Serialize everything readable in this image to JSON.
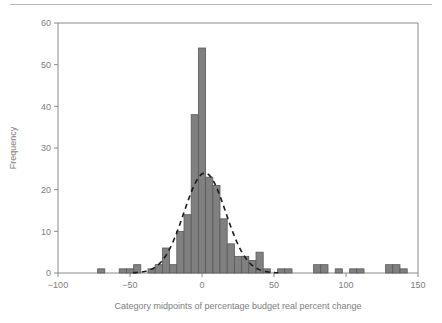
{
  "figure": {
    "background_color": "#ffffff",
    "top_rule_color": "#b9b9b9",
    "axis_color": "#8a8a8a",
    "text_color": "#7d7d7d",
    "bar_fill_color": "#808080",
    "bar_stroke_color": "#595959",
    "curve_color": "#1a1a1a"
  },
  "chart_data": {
    "type": "bar",
    "title": "",
    "subtitle": "",
    "xlabel": "Category midpoints of percentage budget real percent change",
    "ylabel": "Frequency",
    "xlim": [
      -100,
      150
    ],
    "ylim": [
      0,
      60
    ],
    "xticks": [
      -100,
      -50,
      0,
      50,
      100,
      150
    ],
    "xtick_labels": [
      "−100",
      "−50",
      "0",
      "50",
      "100",
      "150"
    ],
    "yticks": [
      0,
      10,
      20,
      30,
      40,
      50,
      60
    ],
    "ytick_labels": [
      "0",
      "10",
      "20",
      "30",
      "40",
      "50",
      "60"
    ],
    "grid": false,
    "legend": "none",
    "bin_width": 5,
    "categories": [
      -70,
      -65,
      -60,
      -55,
      -50,
      -45,
      -40,
      -35,
      -30,
      -25,
      -20,
      -15,
      -10,
      -5,
      0,
      5,
      10,
      15,
      20,
      25,
      30,
      35,
      40,
      45,
      50,
      55,
      60,
      65,
      70,
      75,
      80,
      85,
      90,
      95,
      100,
      105,
      110,
      115,
      120,
      125,
      130,
      135,
      140
    ],
    "values": [
      1,
      0,
      0,
      1,
      1,
      2,
      0,
      1,
      2,
      6,
      2,
      10,
      14,
      38,
      54,
      23,
      21,
      13,
      7,
      4,
      4,
      3,
      5,
      1,
      0,
      1,
      1,
      0,
      0,
      0,
      2,
      2,
      0,
      1,
      0,
      1,
      1,
      0,
      0,
      0,
      2,
      2,
      1
    ],
    "overlay_curve": {
      "name": "normal-fit",
      "style": "dashed",
      "mean": 2,
      "peak_value": 24,
      "sigma": 14.5,
      "x_start": -48,
      "x_end": 53
    }
  }
}
